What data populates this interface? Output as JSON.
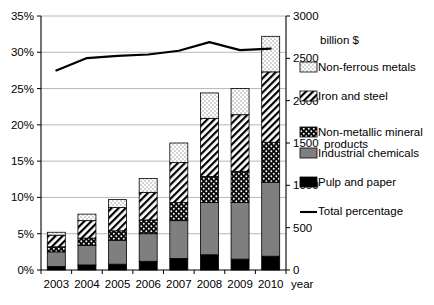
{
  "chart_data": {
    "type": "bar",
    "subtype": "stacked-bar-with-line",
    "title": "",
    "xlabel": "year",
    "ylabel": "",
    "y2label": "billion $",
    "categories": [
      "2003",
      "2004",
      "2005",
      "2006",
      "2007",
      "2008",
      "2009",
      "2010"
    ],
    "ylim": [
      0,
      35
    ],
    "yticks": [
      "0%",
      "5%",
      "10%",
      "15%",
      "20%",
      "25%",
      "30%",
      "35%"
    ],
    "ytick_values": [
      0,
      5,
      10,
      15,
      20,
      25,
      30,
      35
    ],
    "y2lim": [
      0,
      3000
    ],
    "y2ticks": [
      "0",
      "500",
      "1000",
      "1500",
      "2000",
      "2500",
      "3000"
    ],
    "y2tick_values": [
      0,
      500,
      1000,
      1500,
      2000,
      2500,
      3000
    ],
    "grid": true,
    "legend_position": "right",
    "series": [
      {
        "name": "Pulp and paper",
        "pattern": "solid-black",
        "color": "#000000",
        "values": [
          0.5,
          0.7,
          0.8,
          1.2,
          1.6,
          2.1,
          1.5,
          1.9
        ]
      },
      {
        "name": "Industrial chemicals",
        "pattern": "solid-gray",
        "color": "#7f7f7f",
        "values": [
          2.0,
          2.7,
          3.3,
          3.8,
          5.2,
          7.2,
          7.8,
          10.2
        ]
      },
      {
        "name": "Non-metallic mineral products",
        "pattern": "black-with-white-dots",
        "color": "#111111",
        "values": [
          0.7,
          1.0,
          1.3,
          1.9,
          2.5,
          3.6,
          4.3,
          5.5
        ]
      },
      {
        "name": "Iron and steel",
        "pattern": "diagonal-hatch",
        "color": "#ffffff",
        "values": [
          1.6,
          2.4,
          3.2,
          3.8,
          5.5,
          8.0,
          7.8,
          9.7
        ]
      },
      {
        "name": "Non-ferrous metals",
        "pattern": "light-dots",
        "color": "#ffffff",
        "values": [
          0.4,
          0.9,
          1.1,
          1.9,
          2.7,
          3.5,
          3.6,
          4.9
        ]
      }
    ],
    "cumulative_tops": [
      [
        0.5,
        2.5,
        3.2,
        4.8,
        5.2
      ],
      [
        0.7,
        3.4,
        4.4,
        6.8,
        7.7
      ],
      [
        0.8,
        4.1,
        5.4,
        8.6,
        9.7
      ],
      [
        1.2,
        5.0,
        6.9,
        10.7,
        12.6
      ],
      [
        1.6,
        6.8,
        9.3,
        14.8,
        17.5
      ],
      [
        2.1,
        9.3,
        12.9,
        20.9,
        24.4
      ],
      [
        1.5,
        9.3,
        13.6,
        21.4,
        25.0
      ],
      [
        1.9,
        12.1,
        17.6,
        27.3,
        32.2
      ]
    ],
    "line_series": {
      "name": "Total percentage",
      "color": "#000000",
      "values": [
        27.5,
        29.2,
        29.5,
        29.7,
        30.2,
        31.4,
        30.3,
        30.5
      ]
    }
  },
  "legend": {
    "items": [
      {
        "label": "Non-ferrous metals",
        "swatch": "light-dots"
      },
      {
        "label": "Iron and steel",
        "swatch": "diagonal-hatch"
      },
      {
        "label": "Non-metallic mineral",
        "label2": "products",
        "swatch": "black-with-white-dots"
      },
      {
        "label": "Industrial chemicals",
        "swatch": "solid-gray"
      },
      {
        "label": "Pulp and paper",
        "swatch": "solid-black"
      },
      {
        "label": "Total percentage",
        "swatch": "line"
      }
    ]
  }
}
